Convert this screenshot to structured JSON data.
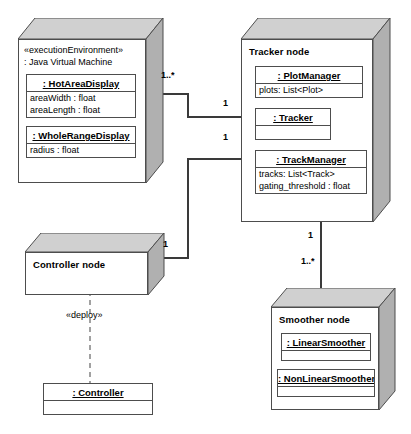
{
  "diagram": {
    "colors": {
      "node_front": "#ffffff",
      "node_top": "#d0d0d0",
      "node_side": "#b0b0b0",
      "line": "#4d4d4d",
      "connector": "#3a3a3a",
      "background": "#ffffff"
    }
  },
  "nodes": {
    "jvm": {
      "stereotype": "«executionEnvironment»",
      "name": ": Java Virtual Machine",
      "classes": [
        {
          "name": ": HotAreaDisplay",
          "attributes": [
            "areaWidth : float",
            "areaLength : float"
          ]
        },
        {
          "name": ": WholeRangeDisplay",
          "attributes": [
            "radius : float"
          ]
        }
      ]
    },
    "tracker": {
      "name": "Tracker node",
      "classes": [
        {
          "name": ": PlotManager",
          "attributes": [
            "plots: List<Plot>"
          ]
        },
        {
          "name": ": Tracker",
          "attributes": []
        },
        {
          "name": ": TrackManager",
          "attributes": [
            "tracks: List<Track>",
            "gating_threshold : float"
          ]
        }
      ]
    },
    "controller": {
      "name": "Controller node",
      "classes": []
    },
    "smoother": {
      "name": "Smoother node",
      "classes": [
        {
          "name": ": LinearSmoother",
          "attributes": []
        },
        {
          "name": ": NonLinearSmoother",
          "attributes": []
        }
      ]
    }
  },
  "artifacts": {
    "controller_class": {
      "name": ": Controller",
      "attributes": []
    }
  },
  "multiplicities": {
    "jvm_to_tracker_source": "1..*",
    "jvm_to_tracker_target": "1",
    "controller_to_tracker_target": "1",
    "controller_to_tracker_source": "1",
    "tracker_to_smoother_source": "1",
    "tracker_to_smoother_target": "1..*"
  },
  "dependencies": {
    "deploy_label": "«deploy»"
  }
}
